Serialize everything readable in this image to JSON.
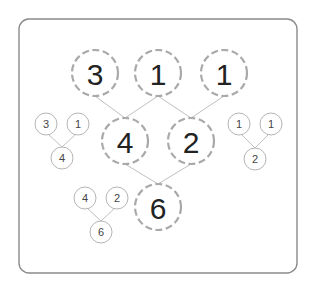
{
  "diagram": {
    "title": "",
    "main_tree": {
      "top_row": [
        {
          "id": "t1",
          "label": "3"
        },
        {
          "id": "t2",
          "label": "1"
        },
        {
          "id": "t3",
          "label": "1"
        }
      ],
      "middle_row": [
        {
          "id": "m1",
          "label": "4"
        },
        {
          "id": "m2",
          "label": "2"
        }
      ],
      "bottom_row": [
        {
          "id": "b1",
          "label": "6"
        }
      ],
      "edges": [
        [
          "t1",
          "m1"
        ],
        [
          "t2",
          "m1"
        ],
        [
          "t2",
          "m2"
        ],
        [
          "t3",
          "m2"
        ],
        [
          "m1",
          "b1"
        ],
        [
          "m2",
          "b1"
        ]
      ]
    },
    "small_trees": [
      {
        "name": "left-pair-sum",
        "left": "3",
        "right": "1",
        "sum": "4"
      },
      {
        "name": "right-pair-sum",
        "left": "1",
        "right": "1",
        "sum": "2"
      },
      {
        "name": "bottom-pair-sum",
        "left": "4",
        "right": "2",
        "sum": "6"
      }
    ],
    "colors": {
      "frame": "#8a8a8a",
      "big_circle_stroke": "#a9a9a9",
      "small_circle_stroke": "#b5b5b5",
      "edge": "#b8b8b8",
      "text": "#222222"
    }
  }
}
